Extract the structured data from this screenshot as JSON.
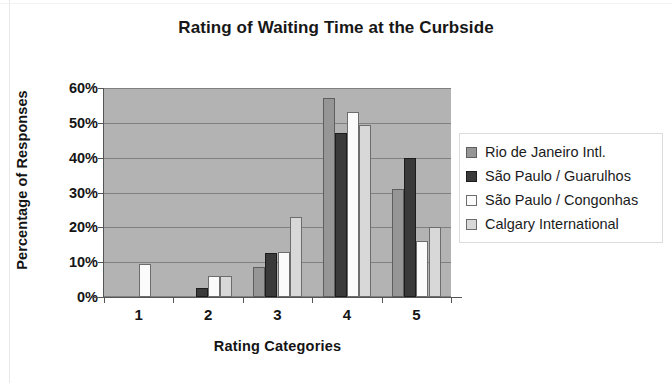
{
  "chart_data": {
    "type": "bar",
    "title": "Rating of Waiting Time at the Curbside",
    "xlabel": "Rating Categories",
    "ylabel": "Percentage of Responses",
    "categories": [
      "1",
      "2",
      "3",
      "4",
      "5"
    ],
    "ytick_labels": [
      "0%",
      "10%",
      "20%",
      "30%",
      "40%",
      "50%",
      "60%"
    ],
    "ytick_values": [
      0,
      10,
      20,
      30,
      40,
      50,
      60
    ],
    "ylim": [
      0,
      60
    ],
    "grid": true,
    "legend_position": "right",
    "series": [
      {
        "name": "Rio de Janeiro Intl.",
        "color": "#969696",
        "values": [
          0,
          0,
          8.5,
          57,
          31
        ]
      },
      {
        "name": "São Paulo / Guarulhos",
        "color": "#3a3a3a",
        "values": [
          0,
          2.5,
          12.5,
          47,
          40
        ]
      },
      {
        "name": "São Paulo / Congonhas",
        "color": "#fbfbfb",
        "values": [
          9.5,
          6,
          13,
          53,
          16
        ]
      },
      {
        "name": "Calgary International",
        "color": "#d8d8d8",
        "values": [
          0,
          6,
          23,
          49.5,
          20
        ]
      }
    ]
  }
}
